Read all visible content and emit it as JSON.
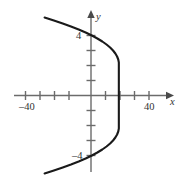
{
  "chart_data": {
    "type": "line",
    "title": "",
    "xlabel": "x",
    "ylabel": "y",
    "xlim": [
      -48,
      54
    ],
    "ylim": [
      -5.7,
      5.6
    ],
    "grid": false,
    "legend_position": "none",
    "x_tick_labels": [
      "-40",
      "40"
    ],
    "y_tick_labels": [
      "4",
      "-4"
    ],
    "x_ticks": [
      -40,
      -30,
      -20,
      -10,
      10,
      20,
      30,
      40
    ],
    "y_ticks": [
      -4,
      -3,
      -2,
      -1,
      1,
      2,
      3,
      4
    ],
    "x_labeled_ticks": [
      -40,
      40
    ],
    "y_labeled_ticks": [
      -4,
      4
    ],
    "curve": {
      "name": "parabola",
      "orientation": "opens-left",
      "vertex": [
        32,
        0
      ],
      "equation": "x = 32 - 2.4 y^2",
      "x": [
        -32,
        -25.6,
        -19.5,
        -13.8,
        -8.5,
        -3.7,
        0.6,
        4.4,
        7.8,
        10.7,
        13.2,
        15.2,
        16.8,
        18.0,
        18.8,
        19.2,
        19.2,
        18.8,
        18.0,
        16.8,
        15.2,
        13.2,
        10.7,
        7.8,
        4.4,
        0.6,
        -3.7,
        -8.5,
        -13.8,
        -19.5,
        -25.6,
        -32
      ],
      "y": [
        -5.2,
        -5.0,
        -4.8,
        -4.6,
        -4.4,
        -4.2,
        -4.0,
        -3.8,
        -3.6,
        -3.4,
        -3.2,
        -3.0,
        -2.8,
        -2.6,
        -2.4,
        -2.2,
        2.2,
        2.4,
        2.6,
        2.8,
        3.0,
        3.2,
        3.4,
        3.6,
        3.8,
        4.0,
        4.2,
        4.4,
        4.6,
        4.8,
        5.0,
        5.2
      ],
      "left_endpoints": [
        [
          -32,
          2.6
        ],
        [
          -32,
          -2.6
        ]
      ]
    },
    "colors": {
      "axis": "#6b6b6b",
      "curve": "#1a1a1a",
      "text": "#333333",
      "background": "#ffffff"
    }
  },
  "labels": {
    "x_negative_40": "–40",
    "x_positive_40": "40",
    "y_positive_4": "4",
    "y_negative_4": "–4",
    "x_axis_name": "x",
    "y_axis_name": "y"
  }
}
